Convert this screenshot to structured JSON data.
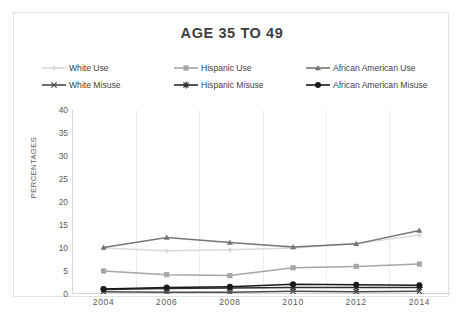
{
  "chart_data": {
    "type": "line",
    "title": "AGE 35 TO 49",
    "xlabel": "",
    "ylabel": "PERCENTAGES",
    "categories": [
      "2004",
      "2006",
      "2008",
      "2010",
      "2012",
      "2014"
    ],
    "ylim": [
      0,
      40
    ],
    "yticks": [
      0,
      5,
      10,
      15,
      20,
      25,
      30,
      35,
      40
    ],
    "grid": "vertical",
    "legend_position": "top",
    "series": [
      {
        "name": "White Use",
        "color": "#d9d9d9",
        "marker": "diamond",
        "values": [
          10.0,
          9.4,
          9.6,
          10.0,
          11.0,
          12.8
        ]
      },
      {
        "name": "Hispanic Use",
        "color": "#a6a6a6",
        "marker": "square",
        "values": [
          5.0,
          4.2,
          4.0,
          5.7,
          6.0,
          6.5
        ]
      },
      {
        "name": "African American Use",
        "color": "#767676",
        "marker": "triangle",
        "values": [
          10.1,
          12.3,
          11.2,
          10.2,
          10.9,
          13.8
        ]
      },
      {
        "name": "White Misuse",
        "color": "#4a4a4a",
        "marker": "x",
        "values": [
          0.5,
          0.4,
          0.4,
          0.6,
          0.5,
          0.6
        ]
      },
      {
        "name": "Hispanic Misuse",
        "color": "#2e2e2e",
        "marker": "asterisk",
        "values": [
          1.0,
          1.2,
          1.3,
          1.4,
          1.4,
          1.4
        ]
      },
      {
        "name": "African American Misuse",
        "color": "#1a1a1a",
        "marker": "circle",
        "values": [
          1.1,
          1.4,
          1.6,
          2.1,
          2.0,
          1.9
        ]
      }
    ]
  },
  "figure": {
    "title": "AGE 35 TO 49",
    "y_axis_title": "PERCENTAGES"
  }
}
